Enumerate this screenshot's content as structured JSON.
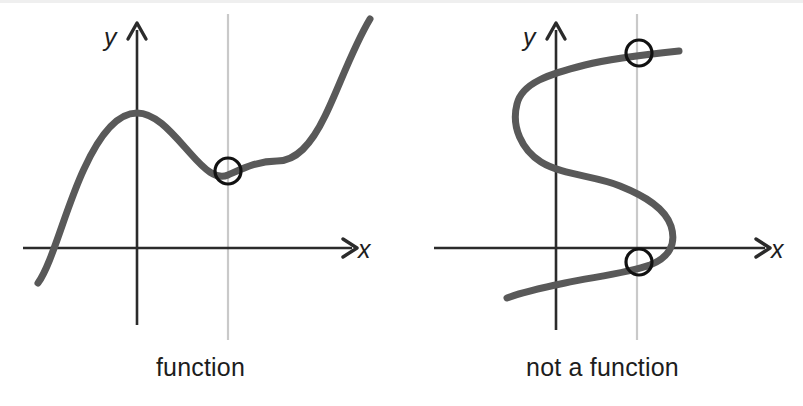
{
  "figure": {
    "title_visible": false,
    "background_color": "#ffffff",
    "width": 803,
    "height": 406,
    "panels": [
      {
        "id": "left",
        "caption": "function",
        "axis_labels": {
          "x": "x",
          "y": "y"
        },
        "origin": {
          "x": 137,
          "y": 248
        },
        "x_axis": {
          "start_x": 23,
          "end_x": 352,
          "y": 248,
          "arrow": true
        },
        "y_axis": {
          "x": 137,
          "start_y": 325,
          "end_y": 24,
          "arrow": true
        },
        "vertical_test_line": {
          "x": 228,
          "top_y": 14,
          "bottom_y": 340,
          "color": "#c9c9c9"
        },
        "curve": {
          "name": "cubic-with-local-max-and-min",
          "color": "#595959",
          "width": 7,
          "path": "M 38 283 C 52 264 66 207 84 169 C 100 134 118 113 137 113 C 156 113 172 133 190 153 C 205 170 216 180 228 175 C 244 168 258 161 277 161 C 296 161 311 145 325 116 C 338 90 352 49 370 19"
        },
        "intersections": [
          {
            "x": 228,
            "y": 171,
            "radius": 13,
            "stroke": "#111111",
            "stroke_width": 3.2
          }
        ],
        "intersection_count": 1
      },
      {
        "id": "right",
        "caption": "not a function",
        "axis_labels": {
          "x": "x",
          "y": "y"
        },
        "origin": {
          "x": 556,
          "y": 248
        },
        "x_axis": {
          "start_x": 434,
          "end_x": 765,
          "y": 248,
          "arrow": true
        },
        "y_axis": {
          "x": 556,
          "start_y": 330,
          "end_y": 22,
          "arrow": true
        },
        "vertical_test_line": {
          "x": 637,
          "top_y": 14,
          "bottom_y": 340,
          "color": "#c9c9c9"
        },
        "curve": {
          "name": "sideways-s-curve",
          "color": "#595959",
          "width": 7,
          "path": "M 679 51 C 650 54 612 58 585 65 C 549 74 522 83 517 104 C 511 127 522 150 541 162 C 562 175 596 176 620 186 C 645 196 665 208 671 226 C 677 245 668 258 650 265 C 628 273 594 277 565 283 C 541 288 520 293 507 298"
        },
        "intersections": [
          {
            "x": 639,
            "y": 53,
            "radius": 13,
            "stroke": "#111111",
            "stroke_width": 3.2
          },
          {
            "x": 639,
            "y": 262,
            "radius": 13,
            "stroke": "#111111",
            "stroke_width": 3.2
          }
        ],
        "intersection_count": 2
      }
    ],
    "colors": {
      "curve": "#595959",
      "axis": "#2b2b2b",
      "test_line": "#c9c9c9",
      "marker_stroke": "#111111",
      "text": "#1d1d1d"
    }
  }
}
